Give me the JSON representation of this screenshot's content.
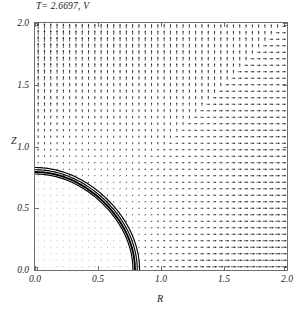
{
  "chart_data": {
    "type": "scatter",
    "plot_kind": "vector-field-quiver",
    "title": "T= 2.6697, V",
    "xlabel": "R",
    "ylabel": "Z",
    "xlim": [
      0.0,
      2.0
    ],
    "ylim": [
      0.0,
      2.0
    ],
    "xticks": [
      0.0,
      0.5,
      1.0,
      1.5,
      2.0
    ],
    "yticks": [
      0.0,
      0.5,
      1.0,
      1.5,
      2.0
    ],
    "xtick_labels": [
      "0.0",
      "0.5",
      "1.0",
      "1.5",
      "2.0"
    ],
    "ytick_labels": [
      "0.0",
      "0.5",
      "1.0",
      "1.5",
      "2.0"
    ],
    "grid": false,
    "legend": null,
    "frame": true,
    "parameters": {
      "T": 2.6697,
      "field": "V"
    },
    "interface": {
      "description": "quarter-arc interface boundary drawn as a thick multi-line band",
      "r_axis_intercept": 0.79,
      "z_axis_intercept": 0.78,
      "radius": 0.79,
      "line_count": 4,
      "color": "#000000"
    },
    "field": {
      "grid_nx": 40,
      "grid_ny": 38,
      "arrow_color": "#111111",
      "inside_magnitude": "near zero (dots)",
      "outside_magnitude": "increases away from interface, max near lower-right and along axes",
      "direction": "outward normal from the interface arc, becoming vertical near the Z axis and horizontal near the R axis"
    }
  },
  "axes": {
    "title": "T= 2.6697, V",
    "xlabel": "R",
    "ylabel": "Z"
  }
}
